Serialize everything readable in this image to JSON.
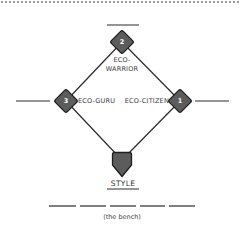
{
  "diagram": {
    "type": "baseball-diamond",
    "colors": {
      "base_fill": "#5c5c5c",
      "base_stroke": "#1e1e1e",
      "line": "#2a2a2a",
      "dotted_border": "#9a9a9a"
    },
    "bases": [
      {
        "id": "first",
        "number": "1",
        "label": "ECO-CITIZEN"
      },
      {
        "id": "second",
        "number": "2",
        "label_line1": "ECO-",
        "label_line2": "WARRIOR"
      },
      {
        "id": "third",
        "number": "3",
        "label": "ECO-GURU"
      }
    ],
    "home_plate": {
      "label": "STYLE"
    },
    "bench": {
      "slots": 5,
      "caption": "(the bench)"
    }
  }
}
